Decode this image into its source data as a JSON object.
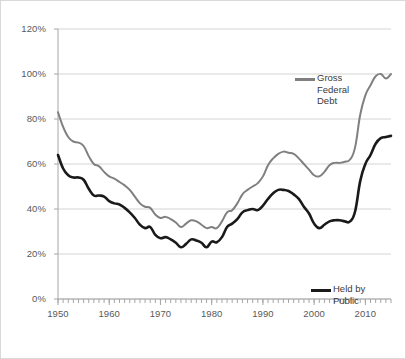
{
  "chart_data": {
    "type": "line",
    "title": "",
    "xlabel": "",
    "ylabel": "",
    "xlim": [
      1950,
      2015
    ],
    "ylim": [
      0,
      120
    ],
    "grid": true,
    "legend_position": "inside-right",
    "y_ticks": [
      "0%",
      "20%",
      "40%",
      "60%",
      "80%",
      "100%",
      "120%"
    ],
    "y_tick_values": [
      0,
      20,
      40,
      60,
      80,
      100,
      120
    ],
    "x_ticks": [
      "1950",
      "1960",
      "1970",
      "1980",
      "1990",
      "2000",
      "2010"
    ],
    "x_tick_values": [
      1950,
      1960,
      1970,
      1980,
      1990,
      2000,
      2010
    ],
    "x_minor_tick_interval": 1,
    "x": [
      1950,
      1951,
      1952,
      1953,
      1954,
      1955,
      1956,
      1957,
      1958,
      1959,
      1960,
      1961,
      1962,
      1963,
      1964,
      1965,
      1966,
      1967,
      1968,
      1969,
      1970,
      1971,
      1972,
      1973,
      1974,
      1975,
      1976,
      1977,
      1978,
      1979,
      1980,
      1981,
      1982,
      1983,
      1984,
      1985,
      1986,
      1987,
      1988,
      1989,
      1990,
      1991,
      1992,
      1993,
      1994,
      1995,
      1996,
      1997,
      1998,
      1999,
      2000,
      2001,
      2002,
      2003,
      2004,
      2005,
      2006,
      2007,
      2008,
      2009,
      2010,
      2011,
      2012,
      2013,
      2014,
      2015
    ],
    "series": [
      {
        "name": "Gross Federal Debt",
        "legend_label": "Gross\nFederal\nDebt",
        "color": "#808080",
        "line_width": 2,
        "values": [
          83.0,
          76.5,
          72.0,
          70.0,
          69.5,
          68.0,
          63.5,
          60.0,
          59.0,
          56.5,
          54.5,
          53.5,
          52.0,
          50.5,
          48.5,
          45.5,
          42.5,
          41.0,
          40.5,
          37.5,
          36.0,
          36.5,
          35.5,
          34.0,
          32.0,
          33.5,
          35.0,
          34.5,
          33.0,
          31.5,
          32.0,
          31.5,
          34.5,
          38.5,
          39.5,
          42.5,
          46.5,
          48.5,
          50.0,
          51.5,
          54.5,
          59.5,
          62.5,
          64.5,
          65.5,
          65.0,
          64.5,
          62.5,
          60.0,
          57.5,
          55.0,
          54.5,
          56.5,
          59.5,
          60.5,
          60.5,
          61.0,
          62.0,
          67.5,
          82.0,
          90.5,
          95.0,
          99.0,
          100.0,
          98.0,
          100.0
        ]
      },
      {
        "name": "Held by Public",
        "legend_label": "Held by\nPublic",
        "color": "#1a1a1a",
        "line_width": 2.6,
        "values": [
          64.0,
          58.0,
          55.0,
          54.0,
          54.0,
          53.0,
          49.0,
          46.0,
          46.0,
          45.5,
          43.5,
          42.5,
          42.0,
          40.5,
          38.5,
          36.0,
          33.0,
          31.5,
          32.0,
          28.5,
          27.0,
          27.5,
          26.5,
          25.0,
          23.0,
          24.5,
          26.5,
          26.0,
          25.0,
          23.0,
          25.5,
          25.2,
          27.5,
          32.0,
          33.5,
          35.5,
          38.5,
          39.5,
          40.0,
          39.5,
          41.5,
          44.5,
          47.0,
          48.5,
          48.5,
          48.0,
          46.5,
          44.5,
          41.0,
          38.0,
          33.5,
          31.5,
          33.0,
          34.5,
          35.0,
          35.0,
          34.5,
          34.5,
          39.0,
          52.5,
          60.0,
          64.0,
          69.0,
          71.5,
          72.0,
          72.5
        ]
      }
    ]
  },
  "legend": {
    "gross_label": "Gross\nFederal\nDebt",
    "public_label": "Held by\nPublic"
  }
}
